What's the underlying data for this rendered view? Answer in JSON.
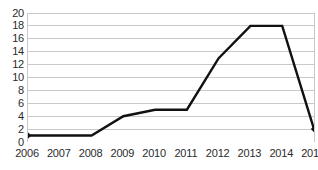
{
  "chart_data": {
    "type": "line",
    "title": "",
    "subtitle": "",
    "xlabel": "",
    "ylabel": "",
    "categories": [
      "2006",
      "2007",
      "2008",
      "2009",
      "2010",
      "2011",
      "2012",
      "2013",
      "2014",
      "2015"
    ],
    "values": [
      1,
      1,
      1,
      4,
      5,
      5,
      13,
      18,
      18,
      2
    ],
    "series": [
      {
        "name": "",
        "values": [
          1,
          1,
          1,
          4,
          5,
          5,
          13,
          18,
          18,
          2
        ]
      }
    ],
    "ylim": [
      0,
      20
    ],
    "ytick_values": [
      0,
      2,
      4,
      6,
      8,
      10,
      12,
      14,
      16,
      18,
      20
    ],
    "ytick_labels": [
      "0",
      "2",
      "4",
      "6",
      "8",
      "10",
      "12",
      "14",
      "16",
      "18",
      "20"
    ],
    "xtick_labels": [
      "2006",
      "2007",
      "2008",
      "2009",
      "2010",
      "2011",
      "2012",
      "2013",
      "2014",
      "2015"
    ],
    "grid": "horizontal",
    "legend": "none",
    "markers": [
      "diamond-first",
      "diamond-last"
    ],
    "colors": {
      "line": "#111111",
      "grid": "#c9c9c9",
      "axis": "#9a9a9a",
      "text": "#2b2b2b",
      "background": "#ffffff"
    },
    "line_width": 2.4,
    "annotations": []
  }
}
